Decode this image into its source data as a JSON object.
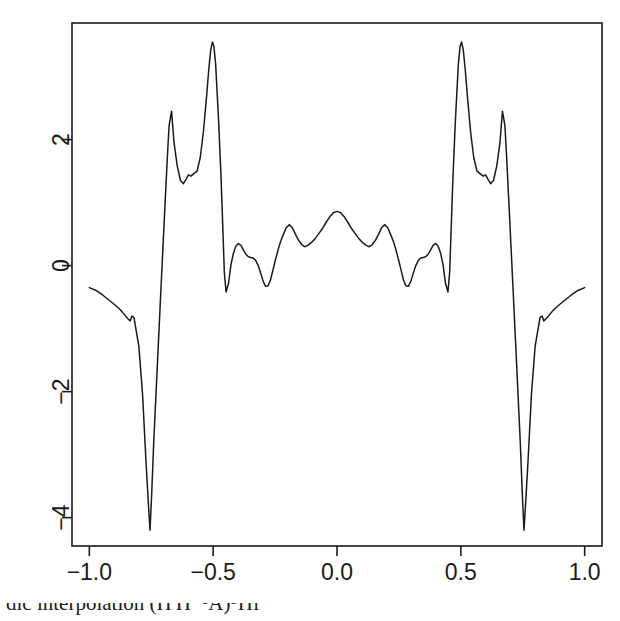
{
  "chart_data": {
    "type": "line",
    "title": "",
    "subtitle": "",
    "xlabel": "",
    "ylabel": "",
    "xlim": [
      -1.07,
      1.07
    ],
    "ylim": [
      -4.45,
      3.85
    ],
    "grid": false,
    "legend": null,
    "x_ticks": [
      -1.0,
      -0.5,
      0.0,
      0.5,
      1.0
    ],
    "x_tick_labels": [
      "-1.0",
      "-0.5",
      "0.0",
      "0.5",
      "1.0"
    ],
    "y_ticks": [
      2,
      0,
      -2,
      -4
    ],
    "y_tick_labels": [
      "2",
      "0",
      "-2",
      "-4"
    ],
    "line_color": "#1a1a1a",
    "line_width": 1.5,
    "series": [
      {
        "name": "wavelet",
        "x": [
          -1.0,
          -0.97,
          -0.945,
          -0.92,
          -0.895,
          -0.875,
          -0.86,
          -0.845,
          -0.835,
          -0.828,
          -0.82,
          -0.8,
          -0.785,
          -0.772,
          -0.762,
          -0.755,
          -0.748,
          -0.74,
          -0.725,
          -0.71,
          -0.695,
          -0.685,
          -0.678,
          -0.668,
          -0.658,
          -0.645,
          -0.632,
          -0.62,
          -0.608,
          -0.6,
          -0.59,
          -0.578,
          -0.565,
          -0.552,
          -0.54,
          -0.528,
          -0.518,
          -0.51,
          -0.503,
          -0.497,
          -0.49,
          -0.478,
          -0.468,
          -0.46,
          -0.455,
          -0.448,
          -0.438,
          -0.428,
          -0.418,
          -0.408,
          -0.398,
          -0.388,
          -0.378,
          -0.368,
          -0.358,
          -0.348,
          -0.338,
          -0.328,
          -0.318,
          -0.308,
          -0.298,
          -0.288,
          -0.278,
          -0.268,
          -0.258,
          -0.248,
          -0.238,
          -0.228,
          -0.218,
          -0.205,
          -0.192,
          -0.18,
          -0.168,
          -0.155,
          -0.142,
          -0.13,
          -0.118,
          -0.105,
          -0.09,
          -0.075,
          -0.06,
          -0.045,
          -0.03,
          -0.015,
          0.0,
          0.015,
          0.03,
          0.045,
          0.06,
          0.075,
          0.09,
          0.105,
          0.118,
          0.13,
          0.142,
          0.155,
          0.168,
          0.18,
          0.192,
          0.205,
          0.218,
          0.228,
          0.238,
          0.248,
          0.258,
          0.268,
          0.278,
          0.288,
          0.298,
          0.308,
          0.318,
          0.328,
          0.338,
          0.348,
          0.358,
          0.368,
          0.378,
          0.388,
          0.398,
          0.408,
          0.418,
          0.428,
          0.438,
          0.448,
          0.455,
          0.46,
          0.468,
          0.478,
          0.49,
          0.497,
          0.503,
          0.51,
          0.518,
          0.528,
          0.54,
          0.552,
          0.565,
          0.578,
          0.59,
          0.6,
          0.608,
          0.62,
          0.632,
          0.645,
          0.658,
          0.668,
          0.678,
          0.685,
          0.695,
          0.71,
          0.725,
          0.74,
          0.748,
          0.755,
          0.762,
          0.772,
          0.785,
          0.8,
          0.82,
          0.828,
          0.835,
          0.845,
          0.86,
          0.875,
          0.895,
          0.92,
          0.945,
          0.97,
          1.0
        ],
        "y": [
          -0.35,
          -0.4,
          -0.47,
          -0.55,
          -0.63,
          -0.7,
          -0.77,
          -0.84,
          -0.88,
          -0.8,
          -0.82,
          -1.28,
          -2.05,
          -3.05,
          -3.75,
          -4.2,
          -3.6,
          -2.8,
          -1.55,
          -0.3,
          0.92,
          1.72,
          2.22,
          2.45,
          1.95,
          1.58,
          1.35,
          1.3,
          1.38,
          1.44,
          1.42,
          1.46,
          1.5,
          1.72,
          2.1,
          2.62,
          3.1,
          3.42,
          3.55,
          3.48,
          3.2,
          2.3,
          1.38,
          0.48,
          -0.1,
          -0.42,
          -0.28,
          0.02,
          0.2,
          0.31,
          0.35,
          0.32,
          0.25,
          0.18,
          0.14,
          0.13,
          0.12,
          0.08,
          0.0,
          -0.12,
          -0.25,
          -0.33,
          -0.32,
          -0.22,
          -0.06,
          0.1,
          0.25,
          0.38,
          0.48,
          0.6,
          0.65,
          0.6,
          0.5,
          0.4,
          0.33,
          0.3,
          0.32,
          0.36,
          0.42,
          0.5,
          0.58,
          0.68,
          0.77,
          0.84,
          0.86,
          0.84,
          0.77,
          0.68,
          0.58,
          0.5,
          0.42,
          0.36,
          0.32,
          0.3,
          0.33,
          0.4,
          0.5,
          0.6,
          0.65,
          0.6,
          0.48,
          0.38,
          0.25,
          0.1,
          -0.06,
          -0.22,
          -0.32,
          -0.33,
          -0.25,
          -0.12,
          0.0,
          0.08,
          0.12,
          0.13,
          0.14,
          0.18,
          0.25,
          0.32,
          0.35,
          0.31,
          0.2,
          0.02,
          -0.28,
          -0.42,
          -0.1,
          0.48,
          1.38,
          2.3,
          3.2,
          3.48,
          3.55,
          3.42,
          3.1,
          2.62,
          2.1,
          1.72,
          1.5,
          1.46,
          1.42,
          1.44,
          1.38,
          1.3,
          1.35,
          1.58,
          1.95,
          2.45,
          2.22,
          1.72,
          0.92,
          -0.3,
          -1.55,
          -2.8,
          -3.6,
          -4.2,
          -3.75,
          -3.05,
          -2.05,
          -1.28,
          -0.82,
          -0.8,
          -0.88,
          -0.84,
          -0.77,
          -0.7,
          -0.63,
          -0.55,
          -0.47,
          -0.4,
          -0.35
        ]
      }
    ],
    "annotations": {
      "peak_outer_left": {
        "x": -0.51,
        "y": 3.55
      },
      "peak_outer_right": {
        "x": 0.51,
        "y": 3.55
      },
      "secondary_peak_left": {
        "x": -0.668,
        "y": 2.45
      },
      "secondary_peak_right": {
        "x": 0.668,
        "y": 2.45
      },
      "trough_left": {
        "x": -0.755,
        "y": -4.2
      },
      "trough_right": {
        "x": 0.755,
        "y": -4.2
      },
      "center_peak": {
        "x": 0.0,
        "y": 0.86
      }
    }
  },
  "axes": {
    "frame": {
      "left": 72,
      "top": 23,
      "right": 602,
      "bottom": 546
    },
    "x_pixel_for": {
      "-1.0": 88,
      "-0.5": 205.5,
      "0.0": 323,
      "0.5": 440.5,
      "1.0": 558
    },
    "y_pixel_for": {
      "2": 138,
      "0": 265.5,
      "-2": 393,
      "-4": 520.5
    }
  },
  "caption": {
    "text": "dic interpolation (Π Π⁻¹A)⁵Πf",
    "visible": "partially clipped at bottom edge"
  }
}
